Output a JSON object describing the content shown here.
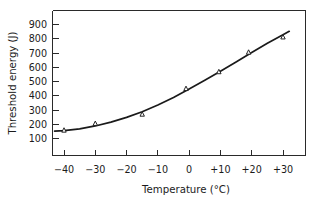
{
  "chart_data": {
    "type": "scatter",
    "title": "",
    "subtitle": "",
    "xlabel": "Temperature (°C)",
    "ylabel": "Threshold energy (J)",
    "xlim": [
      -45,
      35
    ],
    "ylim": [
      50,
      950
    ],
    "grid": false,
    "legend": null,
    "marker_style": "open-triangle",
    "series": [
      {
        "name": "Threshold energy",
        "x": [
          -40,
          -30,
          -15,
          -1,
          9.5,
          19,
          30
        ],
        "values": [
          158,
          205,
          270,
          450,
          568,
          705,
          812
        ]
      }
    ],
    "fit_curve": {
      "name": "fitted curve",
      "x": [
        -43,
        -40,
        -35,
        -30,
        -25,
        -20,
        -15,
        -10,
        -5,
        0,
        5,
        10,
        15,
        20,
        25,
        30,
        32
      ],
      "y": [
        152,
        155,
        168,
        188,
        215,
        248,
        288,
        335,
        388,
        447,
        508,
        572,
        637,
        703,
        768,
        828,
        852
      ]
    },
    "x_ticks": [
      -40,
      -30,
      -20,
      -10,
      0,
      10,
      20,
      30
    ],
    "x_tick_labels": [
      "−40",
      "−30",
      "−20",
      "−10",
      "0",
      "+10",
      "+20",
      "+30"
    ],
    "y_ticks": [
      100,
      200,
      300,
      400,
      500,
      600,
      700,
      800,
      900
    ],
    "y_tick_labels": [
      "100",
      "200",
      "300",
      "400",
      "500",
      "600",
      "700",
      "800",
      "900"
    ],
    "colors": {
      "axis": "#2a2a2a",
      "curve": "#1a1a1a",
      "marker_fill": "#ffffff",
      "marker_stroke": "#1a1a1a",
      "background": "#ffffff",
      "text": "#1b1b1b"
    }
  }
}
